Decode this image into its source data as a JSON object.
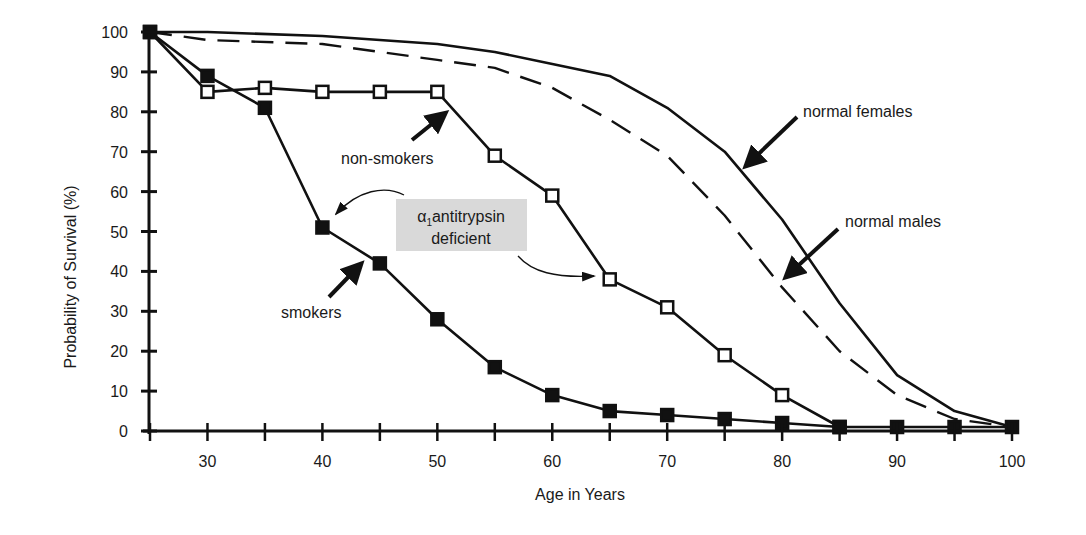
{
  "chart_data": {
    "type": "line",
    "title": "",
    "xlabel": "Age in Years",
    "ylabel": "Probability of Survival (%)",
    "xlim": [
      25,
      100
    ],
    "ylim": [
      0,
      100
    ],
    "x_ticks": [
      25,
      30,
      35,
      40,
      45,
      50,
      55,
      60,
      65,
      70,
      75,
      80,
      85,
      90,
      95,
      100
    ],
    "x_tick_labels": [
      "30",
      "40",
      "50",
      "60",
      "70",
      "80",
      "90",
      "100"
    ],
    "x_tick_label_values": [
      30,
      40,
      50,
      60,
      70,
      80,
      90,
      100
    ],
    "y_ticks": [
      0,
      10,
      20,
      30,
      40,
      50,
      60,
      70,
      80,
      90,
      100
    ],
    "y_tick_labels": [
      "0",
      "10",
      "20",
      "30",
      "40",
      "50",
      "60",
      "70",
      "80",
      "90",
      "100"
    ],
    "grid": false,
    "legend": "none (inline annotations with arrows)",
    "series": [
      {
        "name": "normal females",
        "style": "solid",
        "marker": "none",
        "x": [
          25,
          30,
          40,
          50,
          55,
          60,
          65,
          70,
          75,
          80,
          85,
          90,
          95,
          100
        ],
        "values": [
          100,
          100,
          99,
          97,
          95,
          92,
          89,
          81,
          70,
          53,
          32,
          14,
          5,
          1
        ]
      },
      {
        "name": "normal males",
        "style": "dashed",
        "marker": "none",
        "x": [
          25,
          30,
          40,
          50,
          55,
          60,
          65,
          70,
          75,
          80,
          85,
          90,
          95,
          100
        ],
        "values": [
          100,
          98,
          97,
          93,
          91,
          86,
          78,
          69,
          54,
          36,
          20,
          9,
          3,
          1
        ]
      },
      {
        "name": "α1 antitrypsin deficient non-smokers",
        "style": "solid",
        "marker": "open-square",
        "x": [
          25,
          30,
          35,
          40,
          45,
          50,
          55,
          60,
          65,
          70,
          75,
          80,
          85
        ],
        "values": [
          100,
          85,
          86,
          85,
          85,
          85,
          69,
          59,
          38,
          31,
          19,
          9,
          1
        ]
      },
      {
        "name": "α1 antitrypsin deficient smokers",
        "style": "solid",
        "marker": "filled-square",
        "x": [
          25,
          30,
          35,
          40,
          45,
          50,
          55,
          60,
          65,
          70,
          75,
          80,
          85,
          90,
          95,
          100
        ],
        "values": [
          100,
          89,
          81,
          51,
          42,
          28,
          16,
          9,
          5,
          4,
          3,
          2,
          1,
          1,
          1,
          1
        ]
      }
    ],
    "annotations": [
      {
        "text": "normal females",
        "arrow_to": [
          73,
          72
        ]
      },
      {
        "text": "normal males",
        "arrow_to": [
          80,
          39
        ]
      },
      {
        "text": "non-smokers",
        "arrow_to": [
          51,
          81
        ]
      },
      {
        "text": "smokers",
        "arrow_to": [
          44,
          44
        ]
      },
      {
        "text_main": "antitrypsin",
        "text_symbol": "α",
        "text_subscript": "1",
        "text_line2": "deficient",
        "boxed": true,
        "box_color": "#d9d9d9"
      }
    ]
  },
  "labels": {
    "normal_females": "normal females",
    "normal_males": "normal males",
    "non_smokers": "non-smokers",
    "smokers": "smokers",
    "alpha": "α",
    "alpha_sub": "1",
    "antitrypsin": "antitrypsin",
    "deficient": "deficient",
    "xlabel": "Age in Years",
    "ylabel": "Probability of Survival (%)"
  },
  "colors": {
    "line": "#111111",
    "annotation_box": "#d9d9d9",
    "background": "#ffffff"
  }
}
